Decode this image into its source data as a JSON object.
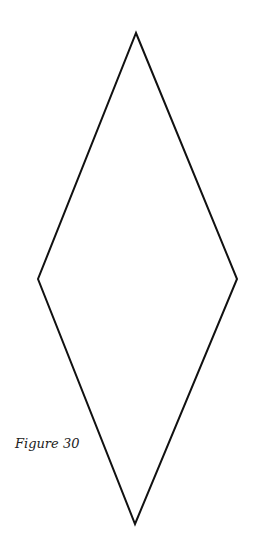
{
  "figure": {
    "caption": "Figure 30",
    "shape": "rhombus",
    "stroke_color": "#111111"
  }
}
